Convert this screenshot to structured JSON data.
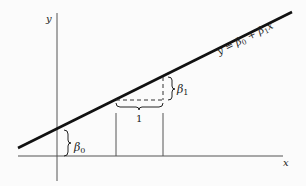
{
  "diagram": {
    "axes": {
      "x_label": "x",
      "y_label": "y"
    },
    "line": {
      "equation_y": "y",
      "equation_eq": " = ",
      "equation_b0": "β",
      "equation_b0_sub": "0",
      "equation_plus": " + ",
      "equation_b1": "β",
      "equation_b1_sub": "1",
      "equation_x": "x"
    },
    "annotations": {
      "intercept_symbol": "β",
      "intercept_sub": "0",
      "slope_symbol": "β",
      "slope_sub": "1",
      "run_label": "1"
    },
    "colors": {
      "line": "#111111",
      "axis": "#555555",
      "background": "#fbfbfb"
    }
  }
}
